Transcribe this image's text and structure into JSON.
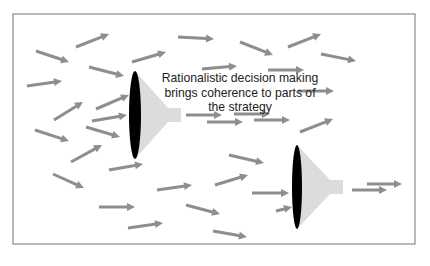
{
  "diagram": {
    "type": "strategy-funnel-illustration",
    "frame": {
      "x": 13,
      "y": 14,
      "width": 402,
      "height": 230,
      "stroke": "#8a8a8a"
    },
    "caption": {
      "lines": [
        "Rationalistic decision making",
        "brings coherence to parts of",
        "the strategy"
      ]
    },
    "colors": {
      "arrow": "#8e8e8e",
      "funnel_mouth": "#000000",
      "funnel_body": "#dcdcdc",
      "caption_text": "#222222"
    },
    "funnels": [
      {
        "name": "funnel-1",
        "mouth_cx": 135,
        "mouth_cy": 115,
        "mouth_rx": 6,
        "mouth_ry": 44,
        "cone_end_x": 168,
        "spout_w": 14,
        "spout_h": 14
      },
      {
        "name": "funnel-2",
        "mouth_cx": 297,
        "mouth_cy": 187,
        "mouth_rx": 5,
        "mouth_ry": 42,
        "cone_end_x": 330,
        "spout_w": 14,
        "spout_h": 14
      }
    ],
    "arrows": [
      {
        "x1": 36,
        "y1": 51,
        "x2": 69,
        "y2": 62
      },
      {
        "x1": 76,
        "y1": 47,
        "x2": 109,
        "y2": 34
      },
      {
        "x1": 27,
        "y1": 86,
        "x2": 62,
        "y2": 81
      },
      {
        "x1": 89,
        "y1": 67,
        "x2": 124,
        "y2": 76
      },
      {
        "x1": 132,
        "y1": 62,
        "x2": 166,
        "y2": 52
      },
      {
        "x1": 178,
        "y1": 37,
        "x2": 214,
        "y2": 39
      },
      {
        "x1": 240,
        "y1": 42,
        "x2": 273,
        "y2": 55
      },
      {
        "x1": 288,
        "y1": 47,
        "x2": 321,
        "y2": 34
      },
      {
        "x1": 321,
        "y1": 54,
        "x2": 356,
        "y2": 61
      },
      {
        "x1": 202,
        "y1": 69,
        "x2": 237,
        "y2": 66
      },
      {
        "x1": 268,
        "y1": 70,
        "x2": 304,
        "y2": 70
      },
      {
        "x1": 298,
        "y1": 91,
        "x2": 334,
        "y2": 91
      },
      {
        "x1": 54,
        "y1": 120,
        "x2": 83,
        "y2": 102
      },
      {
        "x1": 96,
        "y1": 109,
        "x2": 129,
        "y2": 95
      },
      {
        "x1": 92,
        "y1": 121,
        "x2": 127,
        "y2": 115
      },
      {
        "x1": 35,
        "y1": 130,
        "x2": 69,
        "y2": 141
      },
      {
        "x1": 86,
        "y1": 127,
        "x2": 120,
        "y2": 137
      },
      {
        "x1": 71,
        "y1": 162,
        "x2": 102,
        "y2": 145
      },
      {
        "x1": 109,
        "y1": 170,
        "x2": 143,
        "y2": 164
      },
      {
        "x1": 53,
        "y1": 174,
        "x2": 84,
        "y2": 188
      },
      {
        "x1": 186,
        "y1": 115,
        "x2": 222,
        "y2": 115
      },
      {
        "x1": 207,
        "y1": 122,
        "x2": 243,
        "y2": 122
      },
      {
        "x1": 234,
        "y1": 114,
        "x2": 270,
        "y2": 114
      },
      {
        "x1": 254,
        "y1": 120,
        "x2": 290,
        "y2": 120
      },
      {
        "x1": 300,
        "y1": 132,
        "x2": 333,
        "y2": 119
      },
      {
        "x1": 229,
        "y1": 155,
        "x2": 264,
        "y2": 163
      },
      {
        "x1": 215,
        "y1": 185,
        "x2": 248,
        "y2": 175
      },
      {
        "x1": 252,
        "y1": 193,
        "x2": 289,
        "y2": 193
      },
      {
        "x1": 157,
        "y1": 190,
        "x2": 192,
        "y2": 185
      },
      {
        "x1": 99,
        "y1": 207,
        "x2": 135,
        "y2": 207
      },
      {
        "x1": 186,
        "y1": 205,
        "x2": 220,
        "y2": 214
      },
      {
        "x1": 128,
        "y1": 228,
        "x2": 163,
        "y2": 223
      },
      {
        "x1": 213,
        "y1": 231,
        "x2": 247,
        "y2": 237
      },
      {
        "x1": 276,
        "y1": 211,
        "x2": 292,
        "y2": 207
      },
      {
        "x1": 352,
        "y1": 190,
        "x2": 387,
        "y2": 190
      },
      {
        "x1": 367,
        "y1": 184,
        "x2": 402,
        "y2": 184
      }
    ]
  }
}
